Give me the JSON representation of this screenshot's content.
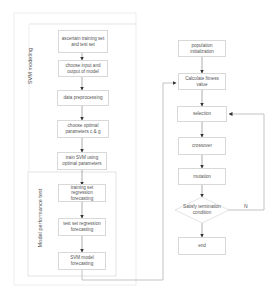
{
  "diagram": {
    "groups": {
      "svm_modeling": {
        "label": "SVM modeling"
      },
      "model_performance_test": {
        "label": "Model performance test"
      }
    },
    "left_column": [
      {
        "id": "ascertain",
        "label": "ascertain training set and test set"
      },
      {
        "id": "choose_io",
        "label": "choose input and output of model"
      },
      {
        "id": "preprocess",
        "label": "data preprocessing"
      },
      {
        "id": "choose_params",
        "label": "choose optimal parameters c & g"
      },
      {
        "id": "train_svm",
        "label": "train SVM using optimal parameters"
      },
      {
        "id": "train_forecast",
        "label": "training set regression forecasting"
      },
      {
        "id": "test_forecast",
        "label": "test set regression forecasting"
      },
      {
        "id": "svm_forecast",
        "label": "SVM model forecasting"
      }
    ],
    "right_column": [
      {
        "id": "pop_init",
        "label": "population initialization"
      },
      {
        "id": "fitness",
        "label": "Calculate fitness value"
      },
      {
        "id": "selection",
        "label": "selection"
      },
      {
        "id": "crossover",
        "label": "crossover"
      },
      {
        "id": "mutation",
        "label": "mutation"
      },
      {
        "id": "terminate",
        "label": "Satisfy termination condition",
        "shape": "diamond"
      },
      {
        "id": "end",
        "label": "end"
      }
    ],
    "edge_labels": {
      "no": "N"
    },
    "colors": {
      "border": "#d8d8d8",
      "line": "#9a9a9a",
      "arrow": "#333333",
      "text": "#555555"
    }
  }
}
